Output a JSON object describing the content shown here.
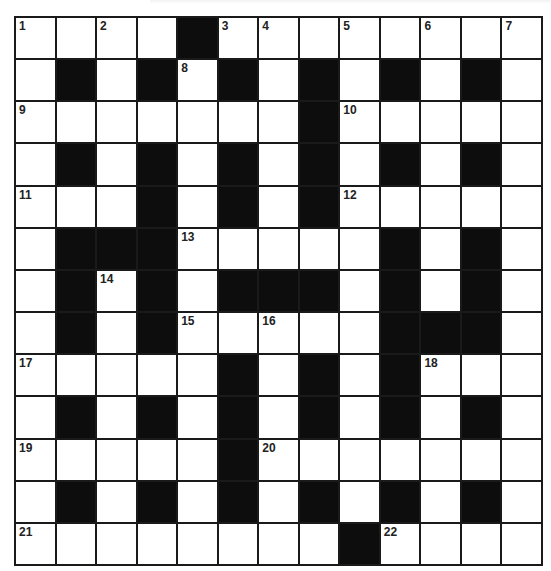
{
  "puzzle": {
    "rows": 13,
    "cols": 13,
    "colors": {
      "block": "#0d0d0d",
      "cell": "#ffffff",
      "gridline": "#1a1a1a",
      "number": "#222222"
    },
    "grid": [
      [
        "1",
        "",
        "2",
        "",
        "#",
        "3",
        "4",
        "",
        "5",
        "",
        "6",
        "",
        "7"
      ],
      [
        "",
        "#",
        "",
        "#",
        "8",
        "#",
        "",
        "#",
        "",
        "#",
        "",
        "#",
        ""
      ],
      [
        "9",
        "",
        "",
        "",
        "",
        "",
        "",
        "#",
        "10",
        "",
        "",
        "",
        ""
      ],
      [
        "",
        "#",
        "",
        "#",
        "",
        "#",
        "",
        "#",
        "",
        "#",
        "",
        "#",
        ""
      ],
      [
        "11",
        "",
        "",
        "#",
        "",
        "#",
        "",
        "#",
        "12",
        "",
        "",
        "",
        ""
      ],
      [
        "",
        "#",
        "#",
        "#",
        "13",
        "",
        "",
        "",
        "",
        "#",
        "",
        "#",
        ""
      ],
      [
        "",
        "#",
        "14",
        "#",
        "",
        "#",
        "#",
        "#",
        "",
        "#",
        "",
        "#",
        ""
      ],
      [
        "",
        "#",
        "",
        "#",
        "15",
        "",
        "16",
        "",
        "",
        "#",
        "#",
        "#",
        ""
      ],
      [
        "17",
        "",
        "",
        "",
        "",
        "#",
        "",
        "#",
        "",
        "#",
        "18",
        "",
        ""
      ],
      [
        "",
        "#",
        "",
        "#",
        "",
        "#",
        "",
        "#",
        "",
        "#",
        "",
        "#",
        ""
      ],
      [
        "19",
        "",
        "",
        "",
        "",
        "#",
        "20",
        "",
        "",
        "",
        "",
        "",
        ""
      ],
      [
        "",
        "#",
        "",
        "#",
        "",
        "#",
        "",
        "#",
        "",
        "#",
        "",
        "#",
        ""
      ],
      [
        "21",
        "",
        "",
        "",
        "",
        "",
        "",
        "",
        "#",
        "22",
        "",
        "",
        ""
      ]
    ],
    "clue_numbers": [
      "1",
      "2",
      "3",
      "4",
      "5",
      "6",
      "7",
      "8",
      "9",
      "10",
      "11",
      "12",
      "13",
      "14",
      "15",
      "16",
      "17",
      "18",
      "19",
      "20",
      "21",
      "22"
    ],
    "entries": {}
  }
}
